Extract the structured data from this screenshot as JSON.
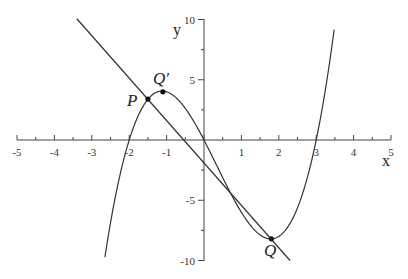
{
  "chart_data": {
    "type": "line",
    "title": "",
    "xlabel": "x",
    "ylabel": "y",
    "xlim": [
      -5,
      5
    ],
    "ylim": [
      -10,
      10
    ],
    "grid": false,
    "x_ticks": [
      -5,
      -4,
      -3,
      -2,
      -1,
      1,
      2,
      3,
      4,
      5
    ],
    "x_tick_labels": [
      "-5",
      "-4",
      "-3",
      "-2",
      "-1",
      "1",
      "2",
      "3",
      "4",
      "5"
    ],
    "y_ticks": [
      10,
      5,
      -5,
      -10
    ],
    "y_tick_labels": [
      "10",
      "5",
      "-5",
      "-10"
    ],
    "series": [
      {
        "name": "cubic curve y = x(x+2)(x-3)",
        "x_range": [
          -2.65,
          3.48
        ],
        "roots": [
          -2,
          0,
          3
        ],
        "color": "#333333"
      },
      {
        "name": "line through P and Q",
        "x_range": [
          -3.4,
          2.3
        ],
        "slope": -3.52,
        "point": [
          -1.5,
          3.375
        ],
        "color": "#333333"
      }
    ],
    "points": [
      {
        "label": "P",
        "x": -1.5,
        "y": 3.4
      },
      {
        "label": "Q'",
        "x": -1.1,
        "y": 4.0
      },
      {
        "label": "Q",
        "x": 1.8,
        "y": -8.2
      }
    ]
  },
  "labels": {
    "x_axis": "x",
    "y_axis": "y",
    "P": "P",
    "Qprime": "Q′",
    "Q": "Q"
  },
  "ticks": {
    "x": [
      "-5",
      "-4",
      "-3",
      "-2",
      "-1",
      "1",
      "2",
      "3",
      "4",
      "5"
    ],
    "y": [
      "10",
      "5",
      "-5",
      "-10"
    ]
  }
}
